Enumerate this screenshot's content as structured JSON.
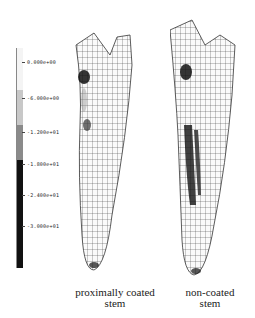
{
  "colorbar": {
    "labels": [
      "0.000e+00",
      "-6.000e+00",
      "-1.200e+01",
      "-1.800e+01",
      "-2.400e+01",
      "-3.000e+01"
    ],
    "segments": [
      {
        "top": 0,
        "height": 42,
        "color": "#f4f4f4"
      },
      {
        "top": 42,
        "height": 35,
        "color": "#c8c8c8"
      },
      {
        "top": 77,
        "height": 35,
        "color": "#8a8a8a"
      },
      {
        "top": 112,
        "height": 108,
        "color": "#111111"
      }
    ],
    "tick_y": [
      62,
      98,
      132,
      164,
      195,
      226
    ]
  },
  "captions": {
    "left_line1": "proximally coated",
    "left_line2": "stem",
    "right_line1": "non-coated",
    "right_line2": "stem"
  }
}
